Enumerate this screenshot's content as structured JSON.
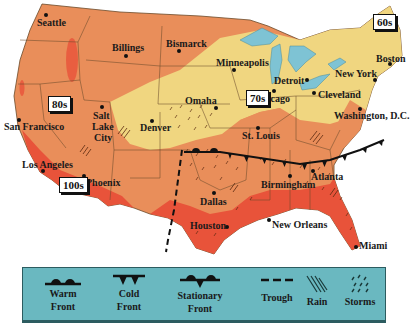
{
  "map": {
    "type": "weather-map",
    "region": "United States",
    "colors": {
      "hot_100s": "#e8533a",
      "hot_90s": "#ec8858",
      "warm_80s": "#e98e5a",
      "mild_70s": "#f0d680",
      "cool_60s": "#f0d680",
      "water": "#7ec3d4",
      "state_lines": "#6b4a2a",
      "legend_bg": "#6ab8c0"
    },
    "temperature_labels": [
      {
        "text": "80s",
        "x": 48,
        "y": 96
      },
      {
        "text": "70s",
        "x": 246,
        "y": 90
      },
      {
        "text": "60s",
        "x": 373,
        "y": 14
      },
      {
        "text": "100s",
        "x": 60,
        "y": 179
      }
    ],
    "cities": [
      {
        "name": "Seattle",
        "label_x": 37,
        "label_y": 18,
        "dot_x": 46,
        "dot_y": 15
      },
      {
        "name": "Billings",
        "label_x": 112,
        "label_y": 43,
        "dot_x": 125,
        "dot_y": 55
      },
      {
        "name": "Bismarck",
        "label_x": 166,
        "label_y": 40,
        "dot_x": 178,
        "dot_y": 50
      },
      {
        "name": "Minneapolis",
        "label_x": 216,
        "label_y": 59,
        "dot_x": 233,
        "dot_y": 69
      },
      {
        "name": "Detroit",
        "label_x": 275,
        "label_y": 77,
        "dot_x": 305,
        "dot_y": 79
      },
      {
        "name": "New York",
        "label_x": 335,
        "label_y": 71,
        "dot_x": 373,
        "dot_y": 79
      },
      {
        "name": "Boston",
        "label_x": 376,
        "label_y": 55,
        "dot_x": 388,
        "dot_y": 63
      },
      {
        "name": "Chicago",
        "label_x": 255,
        "label_y": 94,
        "dot_x": 272,
        "dot_y": 90
      },
      {
        "name": "Cleveland",
        "label_x": 318,
        "label_y": 92,
        "dot_x": 313,
        "dot_y": 92
      },
      {
        "name": "Washington, D.C.",
        "label_x": 334,
        "label_y": 111,
        "dot_x": 359,
        "dot_y": 108
      },
      {
        "name": "Omaha",
        "label_x": 185,
        "label_y": 96,
        "dot_x": 215,
        "dot_y": 107
      },
      {
        "name": "Salt",
        "label_x": 93,
        "label_y": 111,
        "dot_x": 100,
        "dot_y": 106
      },
      {
        "name": "Lake",
        "label_x": 92,
        "label_y": 122,
        "dot_x": null,
        "dot_y": null
      },
      {
        "name": "City",
        "label_x": 94,
        "label_y": 133,
        "dot_x": null,
        "dot_y": null
      },
      {
        "name": "Denver",
        "label_x": 140,
        "label_y": 123,
        "dot_x": 151,
        "dot_y": 119
      },
      {
        "name": "San Francisco",
        "label_x": 4,
        "label_y": 122,
        "dot_x": 18,
        "dot_y": 118
      },
      {
        "name": "St. Louis",
        "label_x": 242,
        "label_y": 131,
        "dot_x": 257,
        "dot_y": 127
      },
      {
        "name": "Los Angeles",
        "label_x": 22,
        "label_y": 163,
        "dot_x": 41,
        "dot_y": 170
      },
      {
        "name": "Phoenix",
        "label_x": 86,
        "label_y": 178,
        "dot_x": 84,
        "dot_y": 175
      },
      {
        "name": "Atlanta",
        "label_x": 311,
        "label_y": 171,
        "dot_x": 311,
        "dot_y": 170
      },
      {
        "name": "Birmingham",
        "label_x": 261,
        "label_y": 180,
        "dot_x": 289,
        "dot_y": 175
      },
      {
        "name": "Dallas",
        "label_x": 200,
        "label_y": 199,
        "dot_x": 213,
        "dot_y": 192
      },
      {
        "name": "Houston",
        "label_x": 190,
        "label_y": 223,
        "dot_x": 225,
        "dot_y": 226
      },
      {
        "name": "New Orleans",
        "label_x": 272,
        "label_y": 222,
        "dot_x": 268,
        "dot_y": 219
      },
      {
        "name": "Miami",
        "label_x": 358,
        "label_y": 242,
        "dot_x": 354,
        "dot_y": 246
      }
    ]
  },
  "legend": {
    "items": [
      {
        "symbol": "warm-front",
        "line1": "Warm",
        "line2": "Front"
      },
      {
        "symbol": "cold-front",
        "line1": "Cold",
        "line2": "Front"
      },
      {
        "symbol": "stationary-front",
        "line1": "Stationary",
        "line2": "Front"
      },
      {
        "symbol": "trough",
        "line1": "Trough",
        "line2": ""
      },
      {
        "symbol": "rain",
        "line1": "Rain",
        "line2": ""
      },
      {
        "symbol": "storms",
        "line1": "Storms",
        "line2": ""
      }
    ]
  }
}
